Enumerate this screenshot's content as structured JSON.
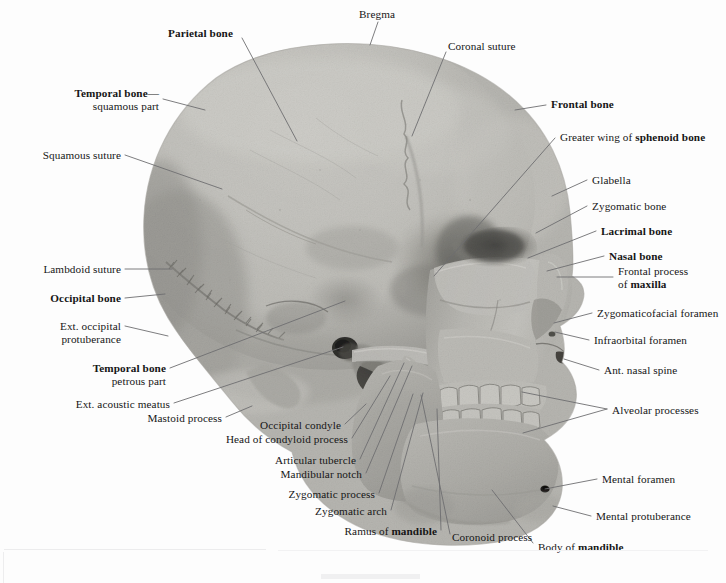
{
  "figure": {
    "view": "left lateral",
    "medium": "photograph",
    "palette": {
      "background": "#fdfdfd",
      "bone_light": "#c9c8c3",
      "bone_mid": "#b3b2ad",
      "bone_shadow": "#8e8d88",
      "bone_deep_shadow": "#6b6a66",
      "cavity_dark": "#3a3a37",
      "leader_line": "#6e6e70",
      "text": "#161616"
    }
  },
  "labels": [
    {
      "id": "bregma",
      "text_runs": [
        {
          "t": "Bregma",
          "b": false
        }
      ],
      "align": "left",
      "x": 359,
      "y": 8,
      "w": 120
    },
    {
      "id": "parietal-bone",
      "text_runs": [
        {
          "t": "Parietal bone",
          "b": true
        }
      ],
      "align": "left",
      "x": 168,
      "y": 27,
      "w": 130
    },
    {
      "id": "coronal-suture",
      "text_runs": [
        {
          "t": "Coronal suture",
          "b": false
        }
      ],
      "align": "left",
      "x": 448,
      "y": 40,
      "w": 130
    },
    {
      "id": "temporal-squamous",
      "text_runs": [
        {
          "t": "Temporal bone—",
          "b": true
        },
        {
          "t": "\n",
          "b": false
        },
        {
          "t": "squamous part",
          "b": false
        }
      ],
      "align": "right",
      "x": 0,
      "y": 87,
      "w": 159
    },
    {
      "id": "frontal-bone",
      "text_runs": [
        {
          "t": "Frontal bone",
          "b": true
        }
      ],
      "align": "left",
      "x": 551,
      "y": 98,
      "w": 130
    },
    {
      "id": "sphenoid-wing",
      "text_runs": [
        {
          "t": "Greater wing of ",
          "b": false
        },
        {
          "t": "sphenoid bone",
          "b": true
        }
      ],
      "align": "left",
      "x": 560,
      "y": 131,
      "w": 165
    },
    {
      "id": "squamous-suture",
      "text_runs": [
        {
          "t": "Squamous suture",
          "b": false
        }
      ],
      "align": "right",
      "x": 0,
      "y": 149,
      "w": 121
    },
    {
      "id": "glabella",
      "text_runs": [
        {
          "t": "Glabella",
          "b": false
        }
      ],
      "align": "left",
      "x": 592,
      "y": 174,
      "w": 120
    },
    {
      "id": "zygomatic-bone",
      "text_runs": [
        {
          "t": "Zygomatic bone",
          "b": false
        }
      ],
      "align": "left",
      "x": 592,
      "y": 200,
      "w": 130
    },
    {
      "id": "lacrimal-bone",
      "text_runs": [
        {
          "t": "Lacrimal bone",
          "b": true
        }
      ],
      "align": "left",
      "x": 601,
      "y": 225,
      "w": 130
    },
    {
      "id": "nasal-bone",
      "text_runs": [
        {
          "t": "Nasal bone",
          "b": true
        }
      ],
      "align": "left",
      "x": 609,
      "y": 250,
      "w": 120
    },
    {
      "id": "lambdoid-suture",
      "text_runs": [
        {
          "t": "Lambdoid suture",
          "b": false
        }
      ],
      "align": "right",
      "x": 0,
      "y": 263,
      "w": 121
    },
    {
      "id": "frontal-process-maxilla",
      "text_runs": [
        {
          "t": "Frontal process",
          "b": false
        },
        {
          "t": "\n",
          "b": false
        },
        {
          "t": "of ",
          "b": false
        },
        {
          "t": "maxilla",
          "b": true
        }
      ],
      "align": "left",
      "x": 618,
      "y": 265,
      "w": 108
    },
    {
      "id": "occipital-bone",
      "text_runs": [
        {
          "t": "Occipital bone",
          "b": true
        }
      ],
      "align": "right",
      "x": 0,
      "y": 292,
      "w": 121
    },
    {
      "id": "zygomaticofacial-foramen",
      "text_runs": [
        {
          "t": "Zygomaticofacial foramen",
          "b": false
        }
      ],
      "align": "left",
      "x": 597,
      "y": 307,
      "w": 129
    },
    {
      "id": "ext-occipital-protuberance",
      "text_runs": [
        {
          "t": "Ext. occipital",
          "b": false
        },
        {
          "t": "\n",
          "b": false
        },
        {
          "t": "protuberance",
          "b": false
        }
      ],
      "align": "right",
      "x": 0,
      "y": 320,
      "w": 121
    },
    {
      "id": "infraorbital-foramen",
      "text_runs": [
        {
          "t": "Infraorbital foramen",
          "b": false
        }
      ],
      "align": "left",
      "x": 594,
      "y": 334,
      "w": 132
    },
    {
      "id": "temporal-petrous",
      "text_runs": [
        {
          "t": "Temporal bone",
          "b": true
        },
        {
          "t": "\n",
          "b": false
        },
        {
          "t": "petrous part",
          "b": false
        }
      ],
      "align": "right",
      "x": 0,
      "y": 362,
      "w": 166
    },
    {
      "id": "ant-nasal-spine",
      "text_runs": [
        {
          "t": "Ant. nasal spine",
          "b": false
        }
      ],
      "align": "left",
      "x": 604,
      "y": 364,
      "w": 122
    },
    {
      "id": "ext-acoustic-meatus",
      "text_runs": [
        {
          "t": "Ext. acoustic meatus",
          "b": false
        }
      ],
      "align": "right",
      "x": 0,
      "y": 398,
      "w": 170
    },
    {
      "id": "alveolar-processes",
      "text_runs": [
        {
          "t": "Alveolar processes",
          "b": false
        }
      ],
      "align": "left",
      "x": 612,
      "y": 404,
      "w": 114
    },
    {
      "id": "mastoid-process",
      "text_runs": [
        {
          "t": "Mastoid process",
          "b": false
        }
      ],
      "align": "right",
      "x": 0,
      "y": 412,
      "w": 222
    },
    {
      "id": "occipital-condyle",
      "text_runs": [
        {
          "t": "Occipital condyle",
          "b": false
        }
      ],
      "align": "right",
      "x": 0,
      "y": 419,
      "w": 341
    },
    {
      "id": "head-condyloid-process",
      "text_runs": [
        {
          "t": "Head of condyloid process",
          "b": false
        }
      ],
      "align": "right",
      "x": 0,
      "y": 433,
      "w": 348
    },
    {
      "id": "articular-tubercle",
      "text_runs": [
        {
          "t": "Articular tubercle",
          "b": false
        }
      ],
      "align": "right",
      "x": 0,
      "y": 454,
      "w": 356
    },
    {
      "id": "mandibular-notch",
      "text_runs": [
        {
          "t": "Mandibular notch",
          "b": false
        }
      ],
      "align": "right",
      "x": 0,
      "y": 468,
      "w": 362
    },
    {
      "id": "zygomatic-process",
      "text_runs": [
        {
          "t": "Zygomatic process",
          "b": false
        }
      ],
      "align": "right",
      "x": 0,
      "y": 488,
      "w": 375
    },
    {
      "id": "mental-foramen",
      "text_runs": [
        {
          "t": "Mental foramen",
          "b": false
        }
      ],
      "align": "left",
      "x": 602,
      "y": 473,
      "w": 124
    },
    {
      "id": "zygomatic-arch",
      "text_runs": [
        {
          "t": "Zygomatic arch",
          "b": false
        }
      ],
      "align": "right",
      "x": 0,
      "y": 505,
      "w": 387
    },
    {
      "id": "mental-protuberance",
      "text_runs": [
        {
          "t": "Mental protuberance",
          "b": false
        }
      ],
      "align": "left",
      "x": 596,
      "y": 510,
      "w": 130
    },
    {
      "id": "ramus-of-mandible",
      "text_runs": [
        {
          "t": "Ramus of ",
          "b": false
        },
        {
          "t": "mandible",
          "b": true
        }
      ],
      "align": "right",
      "x": 0,
      "y": 525,
      "w": 437
    },
    {
      "id": "coronoid-process",
      "text_runs": [
        {
          "t": "Coronoid process",
          "b": false
        }
      ],
      "align": "left",
      "x": 452,
      "y": 531,
      "w": 120
    },
    {
      "id": "body-of-mandible",
      "text_runs": [
        {
          "t": "Body of ",
          "b": false
        },
        {
          "t": "mandible",
          "b": true
        }
      ],
      "align": "left",
      "x": 538,
      "y": 541,
      "w": 120
    }
  ],
  "leader_lines": [
    {
      "id": "bregma",
      "points": "378,22 370,45"
    },
    {
      "id": "parietal-bone",
      "points": "242,38 297,141"
    },
    {
      "id": "coronal-suture",
      "points": "446,52 412,136"
    },
    {
      "id": "temporal-squamous",
      "points": "163,99 205,110"
    },
    {
      "id": "frontal-bone",
      "points": "546,105 515,110"
    },
    {
      "id": "sphenoid-wing",
      "points": "555,138 434,276"
    },
    {
      "id": "squamous-suture",
      "points": "125,155 222,189"
    },
    {
      "id": "glabella",
      "points": "587,180 552,196"
    },
    {
      "id": "zygomatic-bone",
      "points": "587,206 536,233"
    },
    {
      "id": "lacrimal-bone",
      "points": "596,231 528,258"
    },
    {
      "id": "nasal-bone",
      "points": "604,256 547,271"
    },
    {
      "id": "lambdoid-suture",
      "points": "125,269 172,269"
    },
    {
      "id": "frontal-process-maxilla",
      "points": "613,277 557,277"
    },
    {
      "id": "occipital-bone",
      "points": "125,298 165,294"
    },
    {
      "id": "zygomaticofacial-foramen",
      "points": "592,313 554,323"
    },
    {
      "id": "ext-occipital-protuberance",
      "points": "125,326 168,336"
    },
    {
      "id": "infraorbital-foramen",
      "points": "589,340 555,332"
    },
    {
      "id": "temporal-petrous",
      "points": "170,368 345,301"
    },
    {
      "id": "ant-nasal-spine",
      "points": "599,370 564,359"
    },
    {
      "id": "ext-acoustic-meatus",
      "points": "174,403 343,347"
    },
    {
      "id": "alveolar-processes",
      "points": "607,409 522,392"
    },
    {
      "id": "alveolar-processes-2",
      "points": "607,409 523,433"
    },
    {
      "id": "mastoid-process",
      "points": "226,417 252,406"
    },
    {
      "id": "occipital-condyle",
      "points": "345,424 366,404"
    },
    {
      "id": "head-condyloid-process",
      "points": "352,438 390,376"
    },
    {
      "id": "articular-tubercle",
      "points": "360,459 404,363"
    },
    {
      "id": "mandibular-notch",
      "points": "366,473 412,366"
    },
    {
      "id": "zygomatic-process",
      "points": "379,493 413,394"
    },
    {
      "id": "mental-foramen",
      "points": "597,479 545,489"
    },
    {
      "id": "zygomatic-arch",
      "points": "391,510 423,393"
    },
    {
      "id": "mental-protuberance",
      "points": "591,516 553,506"
    },
    {
      "id": "ramus-of-mandible",
      "points": "441,530 437,409"
    },
    {
      "id": "coronoid-process",
      "points": "450,534 421,395"
    },
    {
      "id": "body-of-mandible",
      "points": "533,543 492,490"
    }
  ]
}
